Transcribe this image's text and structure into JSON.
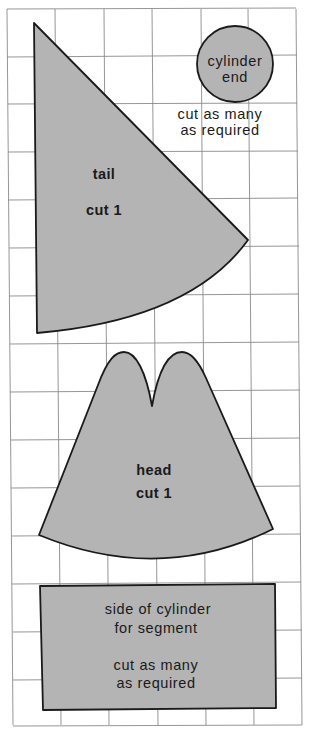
{
  "diagram": {
    "type": "sewing pattern on square grid",
    "grid": {
      "columns": 6,
      "rows": 15,
      "line_color": "#8a8a8a"
    },
    "colors": {
      "piece_fill": "#b4b4b4",
      "outline": "#1a1a1a",
      "background": "#ffffff"
    },
    "pieces": {
      "tail": {
        "name": "tail",
        "instruction": "cut 1"
      },
      "cylinder_end": {
        "name_line1": "cylinder",
        "name_line2": "end",
        "instruction_line1": "cut as many",
        "instruction_line2": "as required"
      },
      "head": {
        "name": "head",
        "instruction": "cut 1"
      },
      "cylinder_side": {
        "name_line1": "side of cylinder",
        "name_line2": "for segment",
        "instruction_line1": "cut as many",
        "instruction_line2": "as required"
      }
    }
  }
}
